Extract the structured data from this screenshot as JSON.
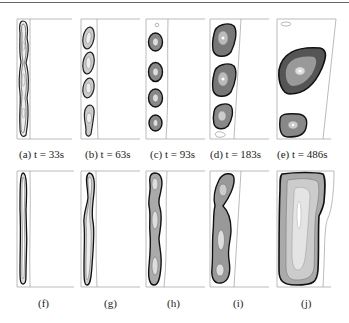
{
  "figure": {
    "rows": [
      {
        "panels": [
          {
            "label": "(a) t = 33s",
            "id": "a"
          },
          {
            "label": "(b) t = 63s",
            "id": "b"
          },
          {
            "label": "(c) t = 93s",
            "id": "c"
          },
          {
            "label": "(d) t = 183s",
            "id": "d"
          },
          {
            "label": "(e) t = 486s",
            "id": "e"
          }
        ]
      },
      {
        "panels": [
          {
            "label": "(f)",
            "id": "f"
          },
          {
            "label": "(g)",
            "id": "g"
          },
          {
            "label": "(h)",
            "id": "h"
          },
          {
            "label": "(i)",
            "id": "i"
          },
          {
            "label": "(j)",
            "id": "j"
          }
        ]
      }
    ],
    "colors": {
      "contour_dark": "#1a1a1a",
      "contour_mid": "#777777",
      "frame": "#999999"
    }
  }
}
